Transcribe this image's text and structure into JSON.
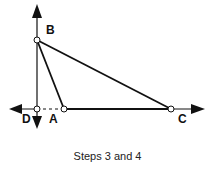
{
  "diagram": {
    "points": {
      "B": {
        "label": "B",
        "x": 37,
        "y": 40
      },
      "D": {
        "label": "D",
        "x": 37,
        "y": 109
      },
      "A": {
        "label": "A",
        "x": 64,
        "y": 109
      },
      "C": {
        "label": "C",
        "x": 171,
        "y": 109
      }
    },
    "segments": [
      "BA",
      "BC",
      "AC"
    ],
    "dashed": [
      "DA"
    ],
    "axes": "vertical line through B and D with arrows; horizontal line through D, A, C with arrows",
    "caption": "Steps 3 and 4",
    "line_color": "#111111"
  }
}
